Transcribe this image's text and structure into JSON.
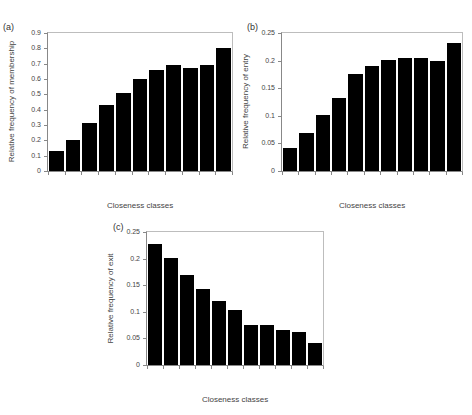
{
  "chart_data": [
    {
      "panel": "(a)",
      "type": "bar",
      "title": "",
      "xlabel": "Closeness classes",
      "ylabel": "Relative frequency of membership",
      "categories": [
        "0-4",
        "5-9",
        "10-14",
        "15-19",
        "20-24",
        "25-29",
        "30-34",
        "35-39",
        "40-44",
        "45-49",
        ">=50"
      ],
      "values": [
        0.13,
        0.2,
        0.31,
        0.43,
        0.51,
        0.6,
        0.66,
        0.69,
        0.67,
        0.69,
        0.8
      ],
      "ylim": [
        0,
        0.9
      ],
      "yticks": [
        "0",
        "0.1",
        "0.2",
        "0.3",
        "0.4",
        "0.5",
        "0.6",
        "0.7",
        "0.8",
        "0.9"
      ],
      "grid": false,
      "bar_color": "#000000"
    },
    {
      "panel": "(b)",
      "type": "bar",
      "title": "",
      "xlabel": "Closeness classes",
      "ylabel": "Relative frequency of entry",
      "categories": [
        "0-4",
        "5-9",
        "10-14",
        "15-19",
        "20-24",
        "25-29",
        "30-34",
        "35-39",
        "40-44",
        "45-49",
        ">=50"
      ],
      "values": [
        0.041,
        0.068,
        0.101,
        0.133,
        0.176,
        0.19,
        0.202,
        0.204,
        0.205,
        0.199,
        0.232
      ],
      "ylim": [
        0,
        0.25
      ],
      "yticks": [
        "0",
        "0.05",
        "0.1",
        "0.15",
        "0.2",
        "0.25"
      ],
      "grid": false,
      "bar_color": "#000000"
    },
    {
      "panel": "(c)",
      "type": "bar",
      "title": "",
      "xlabel": "Closeness classes",
      "ylabel": "Relative frequency of exit",
      "categories": [
        "0-4",
        "5-9",
        "10-14",
        "15-19",
        "20-24",
        "25-29",
        "30-34",
        "35-39",
        "40-44",
        "45-49",
        ">=50"
      ],
      "values": [
        0.228,
        0.201,
        0.17,
        0.143,
        0.121,
        0.104,
        0.076,
        0.076,
        0.065,
        0.062,
        0.042
      ],
      "ylim": [
        0,
        0.25
      ],
      "yticks": [
        "0",
        "0.05",
        "0.1",
        "0.15",
        "0.2",
        "0.25"
      ],
      "grid": false,
      "bar_color": "#000000"
    }
  ],
  "layout": [
    {
      "left": 47,
      "top": 32,
      "width": 186,
      "height": 140,
      "label_x": 3,
      "label_y": 22
    },
    {
      "left": 281,
      "top": 32,
      "width": 182,
      "height": 140,
      "label_x": 247,
      "label_y": 22
    },
    {
      "left": 146,
      "top": 231,
      "width": 178,
      "height": 135,
      "label_x": 113,
      "label_y": 222
    }
  ]
}
